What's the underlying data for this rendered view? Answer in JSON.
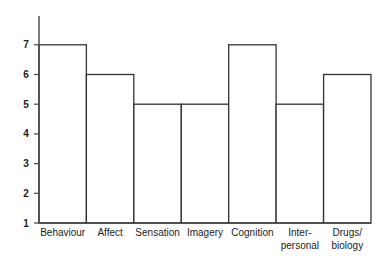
{
  "chart_data": {
    "type": "bar",
    "title": "",
    "xlabel": "",
    "ylabel": "",
    "categories": [
      "Behaviour",
      "Affect",
      "Sensation",
      "Imagery",
      "Cognition",
      "Inter-personal",
      "Drugs/biology"
    ],
    "category_label_lines": [
      [
        "Behaviour"
      ],
      [
        "Affect"
      ],
      [
        "Sensation"
      ],
      [
        "Imagery"
      ],
      [
        "Cognition"
      ],
      [
        "Inter-",
        "personal"
      ],
      [
        "Drugs/",
        "biology"
      ]
    ],
    "values": [
      7,
      6,
      5,
      5,
      7,
      5,
      6
    ],
    "ylim": [
      1,
      8
    ],
    "yticks": [
      1,
      2,
      3,
      4,
      5,
      6,
      7
    ],
    "grid": false,
    "legend": null,
    "bar_fill": "#ffffff",
    "bar_stroke": "#333333",
    "axis_color": "#444444"
  }
}
